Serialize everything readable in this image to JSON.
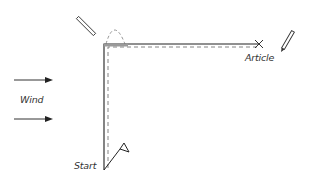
{
  "diagram": {
    "labels": {
      "wind": "Wind",
      "start": "Start",
      "article": "Article"
    },
    "colors": {
      "line": "#222222",
      "dashed": "#777777",
      "thick_segment": "#9a9a9a",
      "text": "#333333",
      "background": "#ffffff"
    },
    "icons": {
      "left_tool": "pencil-icon",
      "right_tool": "pencil-icon",
      "target": "x-mark-icon",
      "start_marker": "flag-icon",
      "wind": "arrow-right-icon"
    }
  }
}
